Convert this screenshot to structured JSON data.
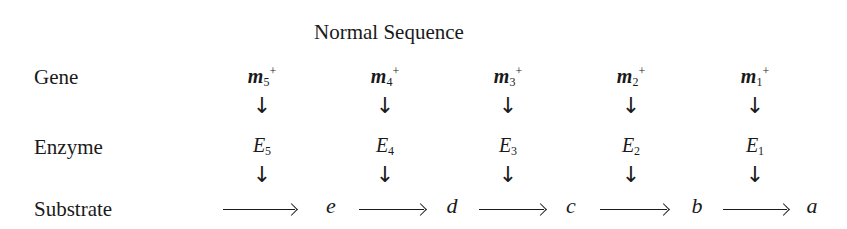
{
  "title": "Normal Sequence",
  "row_labels": {
    "gene": "Gene",
    "enzyme": "Enzyme",
    "substrate": "Substrate"
  },
  "genes": [
    {
      "base": "m",
      "index": "5",
      "sup": "+"
    },
    {
      "base": "m",
      "index": "4",
      "sup": "+"
    },
    {
      "base": "m",
      "index": "3",
      "sup": "+"
    },
    {
      "base": "m",
      "index": "2",
      "sup": "+"
    },
    {
      "base": "m",
      "index": "1",
      "sup": "+"
    }
  ],
  "enzymes": [
    {
      "base": "E",
      "index": "5"
    },
    {
      "base": "E",
      "index": "4"
    },
    {
      "base": "E",
      "index": "3"
    },
    {
      "base": "E",
      "index": "2"
    },
    {
      "base": "E",
      "index": "1"
    }
  ],
  "arrow_glyph": "↓",
  "substrates": [
    "e",
    "d",
    "c",
    "b",
    "a"
  ]
}
